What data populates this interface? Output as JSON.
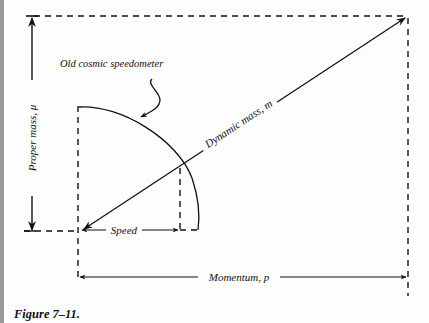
{
  "figure": {
    "caption": "Figure 7–11.",
    "labels": {
      "proper_mass": "Proper mass, μ",
      "dynamic_mass": "Dynamic mass, m",
      "momentum": "Momentum, p",
      "speed": "Speed",
      "speedometer": "Old cosmic speedometer"
    },
    "colors": {
      "ink": "#111111",
      "background": "#fdfdfd",
      "edge_bar": "#9a9a9a"
    }
  }
}
